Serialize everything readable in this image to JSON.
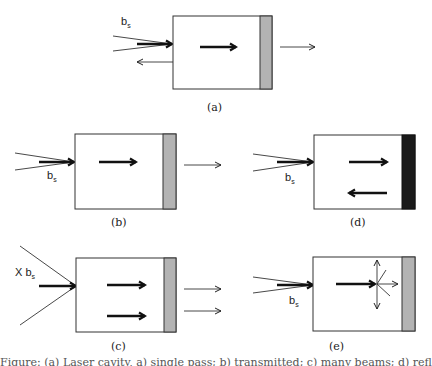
{
  "figure": {
    "panels": [
      {
        "id": "a",
        "caption": "(a)",
        "source_label": "b",
        "source_sub": "s",
        "description": "beam enters box, forward arrow, gray (partially transmitting) mirror, transmitted arrow out right, reflected arrow out left"
      },
      {
        "id": "b",
        "caption": "(b)",
        "source_label": "b",
        "source_sub": "s",
        "description": "beam enters box, forward arrow, gray mirror, transmitted arrow out right"
      },
      {
        "id": "c",
        "caption": "(c)",
        "source_label": "X b",
        "source_sub": "s",
        "description": "wide-angle source, two forward arrows, gray mirror, two transmitted arrows"
      },
      {
        "id": "d",
        "caption": "(d)",
        "source_label": "b",
        "source_sub": "s",
        "description": "beam enters box, forward arrow and backward arrow, black (fully reflecting) mirror"
      },
      {
        "id": "e",
        "caption": "(e)",
        "source_label": "b",
        "source_sub": "s",
        "description": "beam enters box, forward arrow scatters in multiple directions, gray mirror"
      }
    ],
    "colors": {
      "stroke": "#222222",
      "gray_mirror": "#b3b3b3",
      "black_mirror": "#1a1a1a",
      "background": "#ffffff"
    },
    "bottom_caption": "Figure: (a) Laser cavity, a) single pass; b) transmitted; c) many beams; d) reflected; e) scattered"
  }
}
